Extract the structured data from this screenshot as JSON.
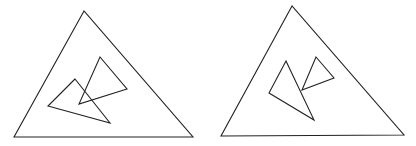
{
  "figures": [
    {
      "name": "figure-left",
      "outer_triangle": [
        [
          84,
          11
        ],
        [
          14,
          137
        ],
        [
          193,
          137
        ]
      ],
      "inner_triangles": [
        [
          [
            75,
            79
          ],
          [
            48,
            106
          ],
          [
            110,
            123
          ]
        ],
        [
          [
            100,
            57
          ],
          [
            127,
            89
          ],
          [
            79,
            104
          ]
        ]
      ],
      "description": "Two small triangles overlapping each other inside a large triangle"
    },
    {
      "name": "figure-right",
      "outer_triangle": [
        [
          292,
          6
        ],
        [
          221,
          136
        ],
        [
          404,
          135
        ]
      ],
      "inner_triangles": [
        [
          [
            286,
            61
          ],
          [
            269,
            93
          ],
          [
            314,
            120
          ]
        ],
        [
          [
            316,
            57
          ],
          [
            334,
            78
          ],
          [
            302,
            90
          ]
        ]
      ],
      "description": "Two small triangles touching but not overlapping inside a large triangle"
    }
  ],
  "colors": {
    "stroke": "#222222",
    "background": "#ffffff"
  }
}
